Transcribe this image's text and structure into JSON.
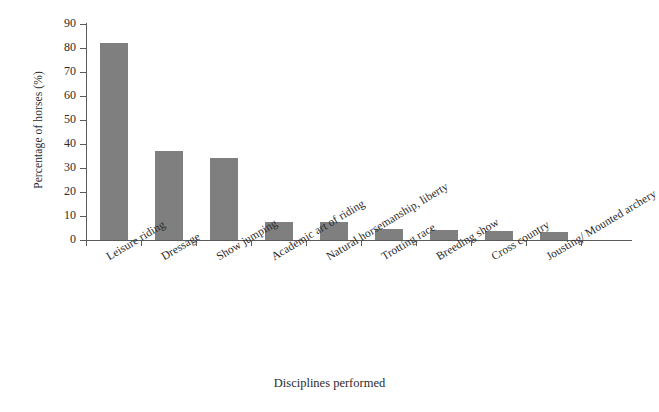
{
  "chart_data": {
    "type": "bar",
    "title": "",
    "xlabel": "Disciplines performed",
    "ylabel": "Percentage of horses (%)",
    "categories": [
      "Leisure riding",
      "Dressage",
      "Show jumping",
      "Academic art of riding",
      "Natural horsemanship, liberty",
      "Trotting race",
      "Breeding show",
      "Cross country",
      "Jousting/ Mounted archery"
    ],
    "values": [
      82,
      37,
      34,
      7.5,
      7.5,
      4.7,
      4,
      3.8,
      3.4
    ],
    "ylim": [
      0,
      90
    ],
    "ytick_labels": [
      "0",
      "10",
      "20",
      "30",
      "40",
      "50",
      "60",
      "70",
      "80",
      "90"
    ],
    "ytick_values": [
      0,
      10,
      20,
      30,
      40,
      50,
      60,
      70,
      80,
      90
    ],
    "grid": false,
    "legend": null,
    "bar_color": "#7f7f7f",
    "axis_color": "#5a5a5a",
    "background": "#ffffff"
  }
}
